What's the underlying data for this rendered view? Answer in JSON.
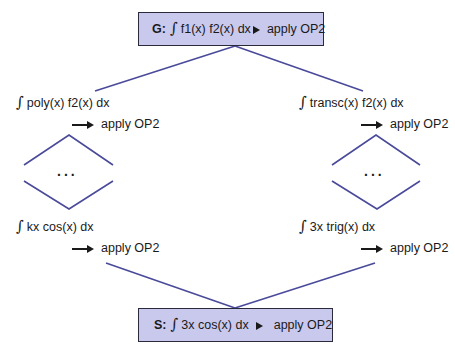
{
  "colors": {
    "box_fill": "#c9c9ee",
    "box_border": "#2a2a3a",
    "edge": "#4a4a9a",
    "text": "#1a1a1a"
  },
  "top_box": {
    "tag": "G:",
    "integral_symbol": "∫",
    "expression": "f1(x) f2(x) dx",
    "arrow": "→",
    "action": "apply OP2"
  },
  "left_branch": {
    "upper": {
      "integral_symbol": "∫",
      "expression": "poly(x) f2(x) dx",
      "action": "apply OP2"
    },
    "ellipsis": "...",
    "lower": {
      "integral_symbol": "∫",
      "expression": "kx cos(x) dx",
      "action": "apply OP2"
    }
  },
  "right_branch": {
    "upper": {
      "integral_symbol": "∫",
      "expression": "transc(x) f2(x) dx",
      "action": "apply OP2"
    },
    "ellipsis": "...",
    "lower": {
      "integral_symbol": "∫",
      "expression": "3x trig(x) dx",
      "action": "apply OP2"
    }
  },
  "bottom_box": {
    "tag": "S:",
    "integral_symbol": "∫",
    "expression": "3x cos(x) dx",
    "arrow": "→",
    "action": "apply OP2"
  }
}
